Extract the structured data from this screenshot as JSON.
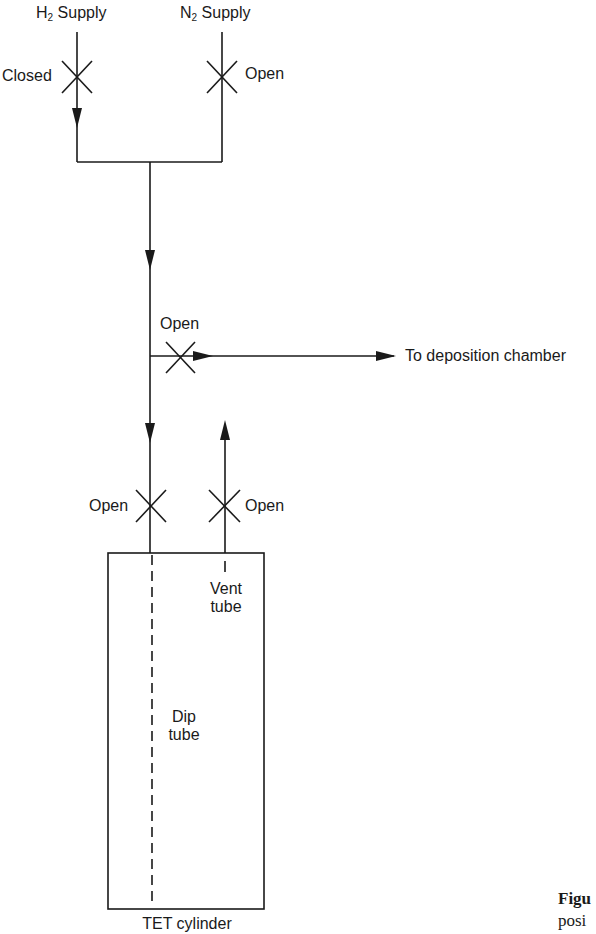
{
  "diagram": {
    "supplies": {
      "h2": {
        "label_main": "H",
        "label_sub": "2",
        "label_rest": " Supply",
        "valve_state": "Closed"
      },
      "n2": {
        "label_main": "N",
        "label_sub": "2",
        "label_rest": " Supply",
        "valve_state": "Open"
      }
    },
    "branch_valve": {
      "state": "Open"
    },
    "outlet": {
      "label": "To deposition chamber"
    },
    "dip_valve": {
      "state": "Open"
    },
    "vent_valve": {
      "state": "Open"
    },
    "cylinder": {
      "label": "TET cylinder",
      "vent_tube_line1": "Vent",
      "vent_tube_line2": "tube",
      "dip_tube_line1": "Dip",
      "dip_tube_line2": "tube"
    },
    "caption": {
      "bold_fragment": "Figu",
      "text_fragment": "posi"
    },
    "colors": {
      "line": "#1a1a1a",
      "background": "#ffffff"
    }
  }
}
